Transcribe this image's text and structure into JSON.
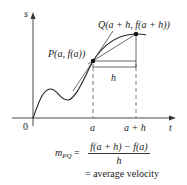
{
  "figure": {
    "axes": {
      "x_label": "t",
      "y_label": "s",
      "origin_label": "0",
      "x_ticks": [
        "a",
        "a + h"
      ]
    },
    "points": {
      "P": {
        "label": "P(a, f(a))"
      },
      "Q": {
        "label": "Q(a + h, f(a + h))"
      }
    },
    "increment_label": "h",
    "formula": {
      "lhs": "m",
      "lhs_subscript": "PQ",
      "equals": "=",
      "numerator": "f(a + h) − f(a)",
      "denominator": "h",
      "second_line": "= average velocity"
    },
    "colors": {
      "line": "#222222",
      "dashed": "#555555",
      "background": "#ffffff"
    }
  }
}
